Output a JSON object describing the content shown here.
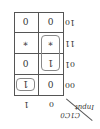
{
  "kmap": {
    "row_var_label": "C1C0",
    "col_var_label": "Input",
    "col_headers": [
      "0",
      "1"
    ],
    "row_headers": [
      "00",
      "01",
      "11",
      "10"
    ],
    "cells": [
      [
        "0",
        "1"
      ],
      [
        "1",
        "0"
      ],
      [
        "*",
        "*"
      ],
      [
        "0",
        "0"
      ]
    ],
    "groups": [
      {
        "cells": "row00-col1"
      },
      {
        "cells": "rows01-11-col0"
      }
    ],
    "orientation": "rotated 180 degrees"
  }
}
